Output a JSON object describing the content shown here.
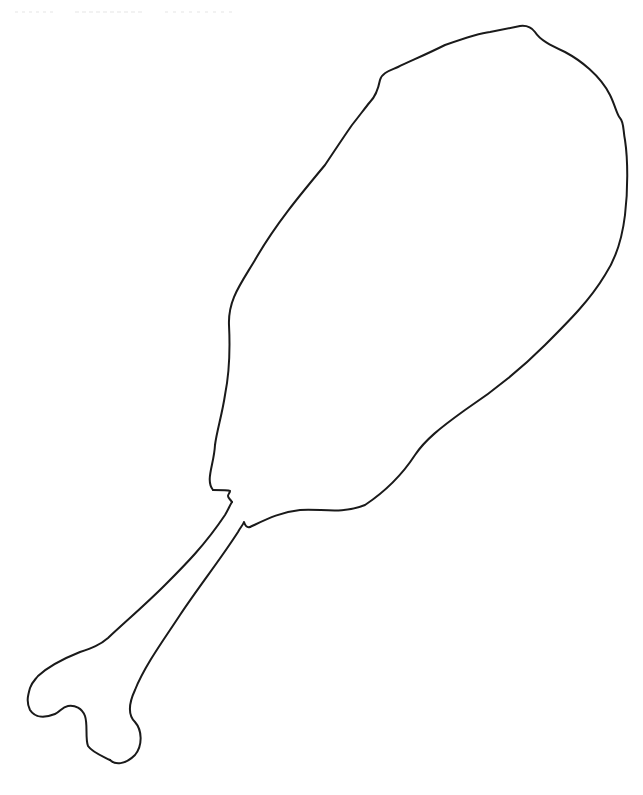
{
  "drawing": {
    "subject": "chicken drumstick outline",
    "style": "coloring-page line art",
    "stroke_color": "#1a1a1a",
    "background_color": "#ffffff",
    "parts": [
      {
        "name": "meat",
        "description": "large rounded meat portion, top-right"
      },
      {
        "name": "bone-shaft",
        "description": "narrow bone extending to bottom-left"
      },
      {
        "name": "bone-knob",
        "description": "two-lobed bone end at bottom-left"
      }
    ]
  }
}
